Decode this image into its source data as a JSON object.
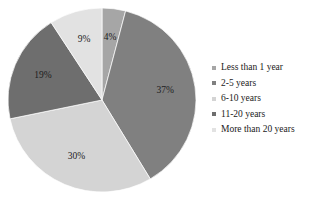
{
  "chart_data": {
    "type": "pie",
    "title": "",
    "xlabel": "",
    "ylabel": "",
    "legend_position": "right",
    "grid": false,
    "categories": [
      "Less than 1 year",
      "2-5 years",
      "6-10 years",
      "11-20 years",
      "More than 20 years"
    ],
    "values": [
      4,
      37,
      30,
      19,
      9
    ],
    "value_labels": [
      "4%",
      "37%",
      "30%",
      "19%",
      "9%"
    ],
    "colors": [
      "#a6a6a6",
      "#808080",
      "#d4d4d4",
      "#6e6e6e",
      "#e2e2e2"
    ],
    "units": "percent",
    "start_angle_deg": 0,
    "direction": "clockwise",
    "slices": [
      {
        "label": "Less than 1 year",
        "value": 4,
        "display": "4%",
        "color": "#a6a6a6"
      },
      {
        "label": "2-5 years",
        "value": 37,
        "display": "37%",
        "color": "#808080"
      },
      {
        "label": "6-10 years",
        "value": 30,
        "display": "30%",
        "color": "#d4d4d4"
      },
      {
        "label": "11-20 years",
        "value": 19,
        "display": "19%",
        "color": "#6e6e6e"
      },
      {
        "label": "More than 20 years",
        "value": 9,
        "display": "9%",
        "color": "#e2e2e2"
      }
    ]
  },
  "legend": {
    "items": [
      {
        "label": "Less than 1 year",
        "color": "#a6a6a6"
      },
      {
        "label": "2-5 years",
        "color": "#808080"
      },
      {
        "label": "6-10 years",
        "color": "#d4d4d4"
      },
      {
        "label": "11-20 years",
        "color": "#6e6e6e"
      },
      {
        "label": "More than 20 years",
        "color": "#e2e2e2"
      }
    ]
  },
  "background": "#ffffff"
}
